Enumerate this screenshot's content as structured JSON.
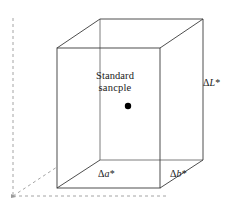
{
  "figure": {
    "type": "3d-color-difference-cube",
    "background_color": "#ffffff",
    "line_color": "#3a3a3a",
    "dashed_color": "#9a9a9a",
    "marker_color": "#000000",
    "center_label": {
      "line1": "Standard",
      "line2": "sancple"
    },
    "marker": {
      "name": "standard-sample-point",
      "cx": 128,
      "cy": 106,
      "r": 3.2
    },
    "axis_labels": {
      "vertical": {
        "delta": "Δ",
        "variable": "L",
        "star": "*"
      },
      "depth_left": {
        "delta": "Δ",
        "variable": "a",
        "star": "*"
      },
      "depth_right": {
        "delta": "Δ",
        "variable": "b",
        "star": "*"
      }
    },
    "geometry": {
      "front_face": [
        [
          57,
          48
        ],
        [
          160,
          48
        ],
        [
          160,
          188
        ],
        [
          57,
          188
        ]
      ],
      "back_face": [
        [
          100,
          19
        ],
        [
          203,
          19
        ],
        [
          203,
          160
        ],
        [
          100,
          160
        ]
      ],
      "connector_edges": [
        [
          [
            57,
            48
          ],
          [
            100,
            19
          ]
        ],
        [
          [
            160,
            48
          ],
          [
            203,
            19
          ]
        ],
        [
          [
            160,
            188
          ],
          [
            203,
            160
          ]
        ],
        [
          [
            57,
            188
          ],
          [
            100,
            160
          ]
        ]
      ],
      "hidden_edges": [
        [
          [
            100,
            160
          ],
          [
            203,
            160
          ]
        ],
        [
          [
            100,
            19
          ],
          [
            100,
            160
          ]
        ]
      ],
      "dashed_axes": {
        "vertical": [
          [
            13,
            18
          ],
          [
            13,
            196
          ]
        ],
        "horizontal": [
          [
            13,
            196
          ],
          [
            168,
            196
          ]
        ],
        "diagonal": [
          [
            13,
            196
          ],
          [
            57,
            167
          ]
        ]
      }
    }
  }
}
